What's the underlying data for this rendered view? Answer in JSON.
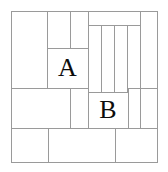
{
  "figure": {
    "background_color": "#ffffff",
    "line_color": "#9a9a9a",
    "label_color": "#0d0d0d",
    "line_width": 1,
    "frame": {
      "x": 11,
      "y": 11,
      "width": 146,
      "height": 151
    },
    "labels": [
      {
        "id": "label-a",
        "text": "A",
        "font_size": 26,
        "x": 47,
        "y": 48,
        "width": 41,
        "height": 40
      },
      {
        "id": "label-b",
        "text": "B",
        "font_size": 26,
        "x": 88,
        "y": 92,
        "width": 40,
        "height": 36
      }
    ],
    "rectangles": [
      {
        "id": "rect-top-left-tall",
        "x": 11,
        "y": 11,
        "width": 36,
        "height": 77
      },
      {
        "id": "rect-top-strip-left",
        "x": 47,
        "y": 11,
        "width": 23,
        "height": 37
      },
      {
        "id": "rect-top-strip-right",
        "x": 70,
        "y": 11,
        "width": 18,
        "height": 37
      },
      {
        "id": "rect-a",
        "x": 47,
        "y": 48,
        "width": 41,
        "height": 40
      },
      {
        "id": "rect-top-right-band",
        "x": 88,
        "y": 11,
        "width": 52,
        "height": 14
      },
      {
        "id": "rect-right-tall-strip",
        "x": 140,
        "y": 11,
        "width": 17,
        "height": 77
      },
      {
        "id": "rect-column-1",
        "x": 88,
        "y": 25,
        "width": 13,
        "height": 67
      },
      {
        "id": "rect-column-2",
        "x": 101,
        "y": 25,
        "width": 13,
        "height": 67
      },
      {
        "id": "rect-column-3",
        "x": 114,
        "y": 25,
        "width": 13,
        "height": 67
      },
      {
        "id": "rect-column-4",
        "x": 127,
        "y": 25,
        "width": 13,
        "height": 67
      },
      {
        "id": "rect-mid-left",
        "x": 11,
        "y": 88,
        "width": 59,
        "height": 40
      },
      {
        "id": "rect-mid-center",
        "x": 70,
        "y": 88,
        "width": 18,
        "height": 40
      },
      {
        "id": "rect-b",
        "x": 88,
        "y": 92,
        "width": 40,
        "height": 36
      },
      {
        "id": "rect-right-lower",
        "x": 128,
        "y": 88,
        "width": 29,
        "height": 40
      },
      {
        "id": "rect-bottom-left",
        "x": 11,
        "y": 128,
        "width": 37,
        "height": 34
      },
      {
        "id": "rect-bottom-center",
        "x": 48,
        "y": 128,
        "width": 67,
        "height": 34
      },
      {
        "id": "rect-bottom-right",
        "x": 115,
        "y": 128,
        "width": 42,
        "height": 34
      }
    ],
    "segments": [
      {
        "id": "frame-top",
        "x1": 11,
        "y1": 11,
        "x2": 157,
        "y2": 11
      },
      {
        "id": "frame-left",
        "x1": 11,
        "y1": 11,
        "x2": 11,
        "y2": 162
      },
      {
        "id": "frame-right",
        "x1": 157,
        "y1": 11,
        "x2": 157,
        "y2": 162
      },
      {
        "id": "frame-bottom",
        "x1": 11,
        "y1": 162,
        "x2": 157,
        "y2": 162
      },
      {
        "id": "v-47-top",
        "x1": 47,
        "y1": 11,
        "x2": 47,
        "y2": 88
      },
      {
        "id": "v-70-top",
        "x1": 70,
        "y1": 11,
        "x2": 70,
        "y2": 48
      },
      {
        "id": "h-48-a-top",
        "x1": 47,
        "y1": 48,
        "x2": 88,
        "y2": 48
      },
      {
        "id": "v-88-main",
        "x1": 88,
        "y1": 11,
        "x2": 88,
        "y2": 128
      },
      {
        "id": "h-25-band",
        "x1": 88,
        "y1": 25,
        "x2": 140,
        "y2": 25
      },
      {
        "id": "v-140-top",
        "x1": 140,
        "y1": 11,
        "x2": 140,
        "y2": 128
      },
      {
        "id": "v-101",
        "x1": 101,
        "y1": 25,
        "x2": 101,
        "y2": 92
      },
      {
        "id": "v-114",
        "x1": 114,
        "y1": 25,
        "x2": 114,
        "y2": 92
      },
      {
        "id": "v-127",
        "x1": 127,
        "y1": 25,
        "x2": 127,
        "y2": 92
      },
      {
        "id": "h-88-left",
        "x1": 11,
        "y1": 88,
        "x2": 88,
        "y2": 88
      },
      {
        "id": "h-88-right",
        "x1": 128,
        "y1": 88,
        "x2": 157,
        "y2": 88
      },
      {
        "id": "v-70-mid",
        "x1": 70,
        "y1": 88,
        "x2": 70,
        "y2": 128
      },
      {
        "id": "h-92-b-top",
        "x1": 88,
        "y1": 92,
        "x2": 128,
        "y2": 92
      },
      {
        "id": "v-128-b-right",
        "x1": 128,
        "y1": 88,
        "x2": 128,
        "y2": 128
      },
      {
        "id": "h-128-full",
        "x1": 11,
        "y1": 128,
        "x2": 157,
        "y2": 128
      },
      {
        "id": "v-48-bottom",
        "x1": 48,
        "y1": 128,
        "x2": 48,
        "y2": 162
      },
      {
        "id": "v-115-bottom",
        "x1": 115,
        "y1": 128,
        "x2": 115,
        "y2": 162
      }
    ]
  }
}
